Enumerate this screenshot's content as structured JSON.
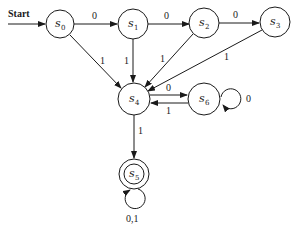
{
  "diagram": {
    "type": "finite-state-machine",
    "start_label": "Start",
    "start_state": "s0",
    "states": [
      {
        "id": "s0",
        "letter": "s",
        "sub": "0",
        "accepting": false
      },
      {
        "id": "s1",
        "letter": "s",
        "sub": "1",
        "accepting": false
      },
      {
        "id": "s2",
        "letter": "s",
        "sub": "2",
        "accepting": false
      },
      {
        "id": "s3",
        "letter": "s",
        "sub": "3",
        "accepting": false
      },
      {
        "id": "s4",
        "letter": "s",
        "sub": "4",
        "accepting": false
      },
      {
        "id": "s5",
        "letter": "s",
        "sub": "5",
        "accepting": true
      },
      {
        "id": "s6",
        "letter": "s",
        "sub": "6",
        "accepting": false
      }
    ],
    "transitions": [
      {
        "from": "s0",
        "to": "s1",
        "label": "0"
      },
      {
        "from": "s1",
        "to": "s2",
        "label": "0"
      },
      {
        "from": "s2",
        "to": "s3",
        "label": "0"
      },
      {
        "from": "s0",
        "to": "s4",
        "label": "1"
      },
      {
        "from": "s1",
        "to": "s4",
        "label": "1"
      },
      {
        "from": "s2",
        "to": "s4",
        "label": "1"
      },
      {
        "from": "s3",
        "to": "s4",
        "label": "1"
      },
      {
        "from": "s4",
        "to": "s6",
        "label": "0"
      },
      {
        "from": "s6",
        "to": "s4",
        "label": "1"
      },
      {
        "from": "s6",
        "to": "s6",
        "label": "0"
      },
      {
        "from": "s4",
        "to": "s5",
        "label": "1"
      },
      {
        "from": "s5",
        "to": "s5",
        "label": "0,1"
      }
    ]
  }
}
